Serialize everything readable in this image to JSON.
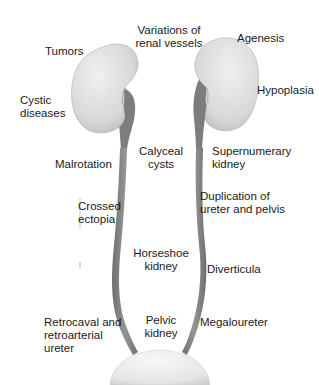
{
  "diagram": {
    "colors": {
      "kidney_fill": "#dcdcdc",
      "kidney_highlight": "#f2f2f2",
      "ureter_fill": "#8a8a8a",
      "ureter_shadow": "#6e6e6e",
      "bladder_fill": "#e8e8e8",
      "text": "#1a1a1a"
    },
    "labels": {
      "variations_renal_vessels": "Variations of\nrenal vessels",
      "tumors": "Tumors",
      "agenesis": "Agenesis",
      "cystic_diseases": "Cystic\ndiseases",
      "hypoplasia": "Hypoplasia",
      "malrotation": "Malrotation",
      "calyceal_cysts": "Calyceal\ncysts",
      "supernumerary_kidney": "Supernumerary\nkidney",
      "crossed_ectopia": "Crossed\nectopia",
      "duplication": "Duplication of\nureter and pelvis",
      "horseshoe_kidney": "Horseshoe\nkidney",
      "diverticula": "Diverticula",
      "retrocaval_ureter": "Retrocaval and\nretroarterial\nureter",
      "pelvic_kidney": "Pelvic\nkidney",
      "megaloureter": "Megaloureter"
    }
  }
}
